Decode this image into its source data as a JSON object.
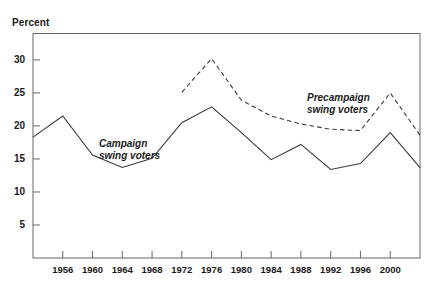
{
  "chart_data": {
    "type": "line",
    "title": "",
    "subtitle": "",
    "xlabel": "",
    "ylabel": "Percent",
    "ylim": [
      0,
      34
    ],
    "xlim": [
      1952,
      2004
    ],
    "grid": false,
    "legend_position": "inline-annotations",
    "y_ticks": [
      5,
      10,
      15,
      20,
      25,
      30
    ],
    "x_ticks": [
      1952,
      1956,
      1960,
      1964,
      1968,
      1972,
      1976,
      1980,
      1984,
      1988,
      1992,
      1996,
      2000,
      2004
    ],
    "x_tick_labels": [
      "",
      "1956",
      "1960",
      "1964",
      "1968",
      "1972",
      "1976",
      "1980",
      "1984",
      "1988",
      "1992",
      "1996",
      "2000",
      ""
    ],
    "x": [
      1952,
      1956,
      1960,
      1964,
      1968,
      1972,
      1976,
      1980,
      1984,
      1988,
      1992,
      1996,
      2000,
      2004
    ],
    "series": [
      {
        "name": "Campaign swing voters",
        "style": "solid",
        "color": "#3a3a3a",
        "x": [
          1952,
          1956,
          1960,
          1964,
          1968,
          1972,
          1976,
          1980,
          1984,
          1988,
          1992,
          1996,
          2000,
          2004
        ],
        "values": [
          18.3,
          21.5,
          15.6,
          13.7,
          15.1,
          20.5,
          22.9,
          19.0,
          14.9,
          17.2,
          13.4,
          14.3,
          19.0,
          13.7
        ]
      },
      {
        "name": "Precampaign swing voters",
        "style": "dashed",
        "color": "#3a3a3a",
        "x": [
          1972,
          1976,
          1980,
          1984,
          1988,
          1992,
          1996,
          2000,
          2004
        ],
        "values": [
          25.1,
          30.2,
          23.9,
          21.5,
          20.3,
          19.5,
          19.3,
          25.0,
          18.6
        ]
      }
    ],
    "annotations": [
      {
        "name": "campaign-series-label",
        "text": "Campaign\nswing voters",
        "x": 1961.5,
        "y": 17.8
      },
      {
        "name": "precampaign-series-label",
        "text": "Precampaign\nswing voters",
        "x": 1991.5,
        "y": 24.0
      }
    ]
  },
  "axis": {
    "y_title": "Percent",
    "y_tick_labels": [
      "30",
      "25",
      "20",
      "15",
      "10",
      "5"
    ],
    "x_tick_labels": [
      "1956",
      "1960",
      "1964",
      "1968",
      "1972",
      "1976",
      "1980",
      "1984",
      "1988",
      "1992",
      "1996",
      "2000"
    ]
  },
  "labels": {
    "campaign": "Campaign\nswing voters",
    "precampaign": "Precampaign\nswing voters"
  },
  "colors": {
    "line": "#3a3a3a",
    "frame": "#555555",
    "text": "#1a1a1a",
    "background": "#ffffff"
  }
}
